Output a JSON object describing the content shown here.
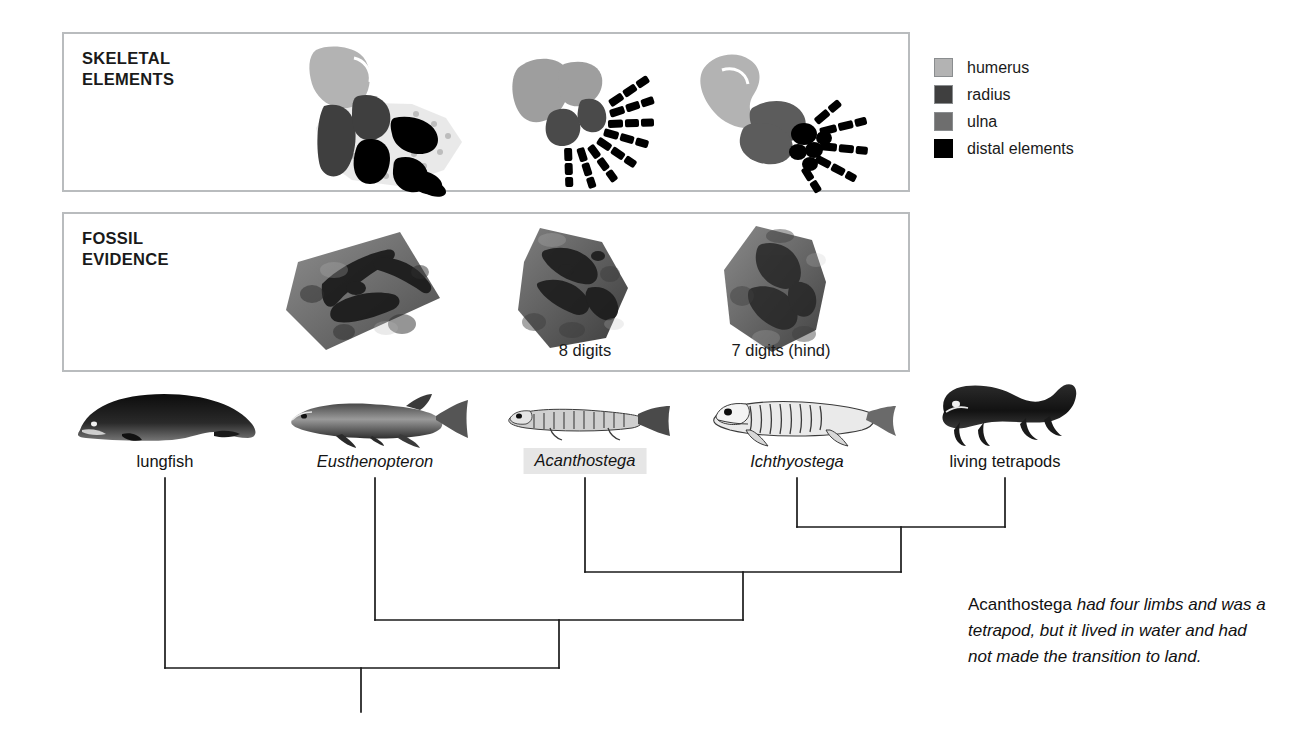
{
  "figure": {
    "panels": [
      {
        "id": "skeletal",
        "title": "SKELETAL\nELEMENTS"
      },
      {
        "id": "fossil",
        "title": "FOSSIL\nEVIDENCE"
      }
    ],
    "legend": {
      "items": [
        {
          "label": "humerus",
          "color": "#b3b3b3"
        },
        {
          "label": "radius",
          "color": "#3f3f3f"
        },
        {
          "label": "ulna",
          "color": "#6e6e6e"
        },
        {
          "label": "distal elements",
          "color": "#000000"
        }
      ]
    },
    "fossil_labels": [
      {
        "text": "8 digits",
        "x": 585
      },
      {
        "text": "7 digits (hind)",
        "x": 781
      }
    ],
    "taxa": [
      {
        "name": "lungfish",
        "style": "roman",
        "x": 165,
        "highlight": false,
        "silhouette": "lungfish-silhouette"
      },
      {
        "name": "Eusthenopteron",
        "style": "italic",
        "x": 375,
        "highlight": false,
        "silhouette": "eusthenopteron-silhouette"
      },
      {
        "name": "Acanthostega",
        "style": "italic",
        "x": 585,
        "highlight": true,
        "silhouette": "acanthostega-skeleton"
      },
      {
        "name": "Ichthyostega",
        "style": "italic",
        "x": 797,
        "highlight": false,
        "silhouette": "ichthyostega-skeleton"
      },
      {
        "name": "living tetrapods",
        "style": "roman",
        "x": 1005,
        "highlight": false,
        "silhouette": "salamander-silhouette"
      }
    ],
    "caption": {
      "lead": "Acanthostega",
      "rest": " had four limbs and was a tetrapod, but it lived in water and had not made the transition to land."
    },
    "cladogram": {
      "stroke": "#1a1a1a",
      "tips_y": 478,
      "nodes": [
        {
          "name": "ichthyostega-living-tetrapods-node",
          "left_x": 797,
          "right_x": 1005,
          "y": 527
        },
        {
          "name": "acanthostega-node",
          "left_x": 585,
          "right_x": 901,
          "y": 572
        },
        {
          "name": "eusthenopteron-node",
          "left_x": 375,
          "right_x": 743,
          "y": 620
        },
        {
          "name": "root-node",
          "left_x": 165,
          "right_x": 559,
          "y": 668
        }
      ],
      "root_stem": {
        "x": 361,
        "y_top": 668,
        "y_bottom": 712
      }
    },
    "colors": {
      "humerus": "#b3b3b3",
      "radius": "#3f3f3f",
      "ulna": "#6e6e6e",
      "distal": "#000000",
      "panel_border": "#b9bcbe",
      "highlight": "#e6e6e6",
      "ink": "#1a1a1a"
    }
  }
}
